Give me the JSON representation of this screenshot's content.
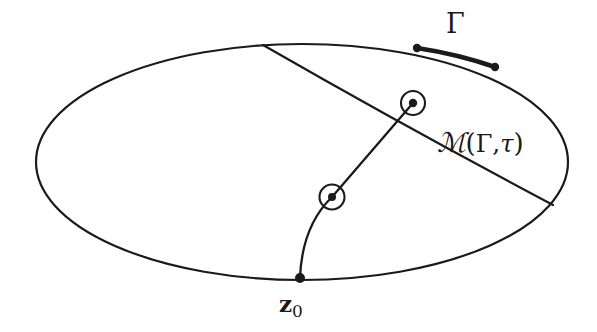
{
  "figure": {
    "kind": "mathematical-diagram",
    "background_color": "#ffffff",
    "stroke_color": "#1a1a1a"
  },
  "labels": {
    "gamma": "Γ",
    "manifold_calligraphic_m": "ℳ",
    "manifold_open_paren": "(",
    "manifold_gamma": "Γ",
    "manifold_comma": ",",
    "manifold_tau": "τ",
    "manifold_close_paren": ")",
    "manifold_full": "ℳ(Γ, τ)",
    "base_point": "z",
    "base_point_subscript": "0",
    "base_point_full": "z₀"
  },
  "geometry": {
    "ellipse": {
      "center_x": 302,
      "center_y": 162,
      "radius_x": 266,
      "radius_y": 118,
      "stroke_width": 2.2
    },
    "gamma_arc": {
      "start_x": 417,
      "start_y": 48,
      "end_x": 495,
      "end_y": 67,
      "stroke_width": 4.6
    },
    "gamma_endpoint_dots": [
      {
        "x": 417,
        "y": 48,
        "r": 4.2
      },
      {
        "x": 495,
        "y": 67,
        "r": 4.2
      }
    ],
    "manifold_curve": {
      "start_x": 263,
      "start_y": 45,
      "control_x": 404,
      "control_y": 126,
      "end_x": 553,
      "end_y": 205,
      "stroke_width": 2.2
    },
    "curve_crossing": {
      "x": 375,
      "y": 145
    },
    "path_from_base": {
      "base_x": 300,
      "base_y": 278,
      "mid_x": 332,
      "mid_y": 197,
      "tip_x": 413,
      "tip_y": 103,
      "stroke_width": 2.2
    },
    "base_point_dot": {
      "x": 300,
      "y": 278,
      "r": 5.0
    },
    "circled_points": [
      {
        "x": 332,
        "y": 197,
        "circle_r": 12.5,
        "dot_r": 4.0
      },
      {
        "x": 413,
        "y": 103,
        "circle_r": 12.0,
        "dot_r": 4.2
      }
    ]
  }
}
